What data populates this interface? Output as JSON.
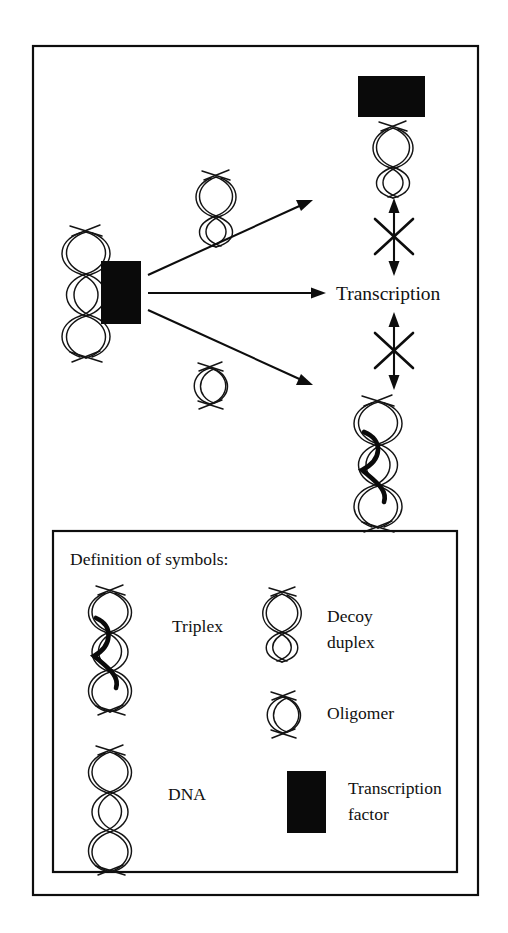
{
  "figure": {
    "kind": "biology-mechanism-diagram",
    "topic": "Transcription factor binding and its inhibition by decoy duplex, oligomer and triplex",
    "colors": {
      "ink": "#0d0d0d",
      "strand": "#141414",
      "transcription_factor_fill": "#0a0a0a",
      "background": "#ffffff"
    }
  },
  "main_panel": {
    "center_label": "Transcription",
    "pathways": [
      {
        "id": "decoy-pathway",
        "reagent_symbol": "decoy duplex",
        "arrow_direction": "up-right",
        "outcome_symbol": "decoy duplex bound by transcription factor",
        "outcome_effect": "blocked",
        "effect_symbol": "crossed double-headed arrow"
      },
      {
        "id": "direct-pathway",
        "reagent_symbol": "none",
        "arrow_direction": "right",
        "outcome_symbol": "Transcription",
        "outcome_effect": "proceeds",
        "effect_symbol": "none"
      },
      {
        "id": "triplex-pathway",
        "reagent_symbol": "oligomer",
        "arrow_direction": "down-right",
        "outcome_symbol": "triplex",
        "outcome_effect": "blocked",
        "effect_symbol": "crossed double-headed arrow"
      }
    ],
    "source_symbols": [
      {
        "symbol": "DNA",
        "note": "double helix at left"
      },
      {
        "symbol": "transcription factor",
        "note": "filled black rectangle bound to DNA"
      }
    ]
  },
  "legend": {
    "title": "Definition of symbols:",
    "entries": [
      {
        "label": "Triplex",
        "symbol": "triplex-helix-icon",
        "column": "left",
        "row": 1
      },
      {
        "label": "Decoy\nduplex",
        "label_line1": "Decoy",
        "label_line2": "duplex",
        "symbol": "decoy-duplex-icon",
        "column": "right",
        "row": 1
      },
      {
        "label": "Oligomer",
        "symbol": "oligomer-icon",
        "column": "right",
        "row": 2
      },
      {
        "label": "DNA",
        "symbol": "dna-helix-icon",
        "column": "left",
        "row": 3
      },
      {
        "label": "Transcription\nfactor",
        "label_line1": "Transcription",
        "label_line2": "factor",
        "symbol": "transcription-factor-icon",
        "column": "right",
        "row": 3
      }
    ]
  }
}
